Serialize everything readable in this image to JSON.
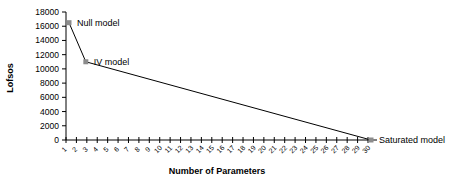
{
  "chart_data": {
    "type": "line",
    "title": "",
    "xlabel": "Number of Parameters",
    "ylabel": "Lofsos",
    "xlim": [
      1,
      30
    ],
    "ylim": [
      0,
      18000
    ],
    "x_ticks": [
      1,
      2,
      3,
      4,
      5,
      6,
      7,
      8,
      9,
      10,
      11,
      12,
      13,
      14,
      15,
      16,
      17,
      18,
      19,
      20,
      21,
      22,
      23,
      24,
      25,
      26,
      27,
      28,
      29,
      30
    ],
    "y_ticks": [
      0,
      2000,
      4000,
      6000,
      8000,
      10000,
      12000,
      14000,
      16000,
      18000
    ],
    "grid": false,
    "legend": null,
    "series": [
      {
        "name": "Models",
        "x": [
          1,
          3,
          30
        ],
        "y": [
          16500,
          11000,
          0
        ],
        "labels": [
          "Null model",
          "IV model",
          "Saturated model"
        ]
      }
    ],
    "colors": {
      "line": "#000000",
      "marker": "#8c8c8c"
    }
  }
}
